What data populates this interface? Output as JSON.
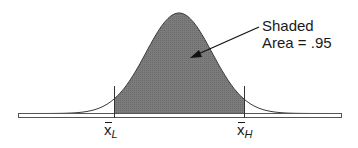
{
  "chart_data": {
    "type": "area",
    "title": "",
    "xlabel": "",
    "ylabel": "",
    "grid": false,
    "x_markers": [
      {
        "label": "x̄",
        "subscript": "L",
        "position_px": 114
      },
      {
        "label": "x̄",
        "subscript": "H",
        "position_px": 244
      }
    ],
    "shaded_area": 0.95,
    "annotation": {
      "line1": "Shaded",
      "line2": "Area = .95"
    },
    "colors": {
      "shade": "#7a7a7a",
      "curve": "#3a3a3a",
      "baseline_fill": "#ffffff"
    }
  },
  "labels": {
    "annotation_line1": "Shaded",
    "annotation_line2": "Area = .95",
    "lower_symbol": "x",
    "lower_sub": "L",
    "upper_symbol": "x",
    "upper_sub": "H"
  }
}
